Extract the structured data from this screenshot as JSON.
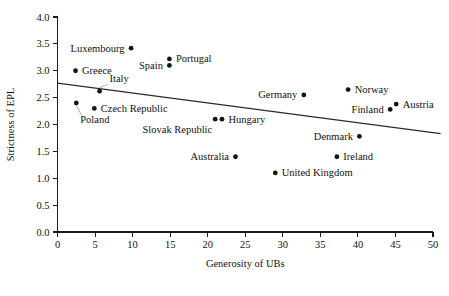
{
  "chart_data": {
    "type": "scatter",
    "title": "",
    "xlabel": "Generosity of UBs",
    "ylabel": "Strictness of EPL",
    "xlim": [
      0,
      50
    ],
    "ylim": [
      0,
      4.0
    ],
    "xticks": [
      0,
      5,
      10,
      15,
      20,
      25,
      30,
      35,
      40,
      45,
      50
    ],
    "xtick_labels": [
      "0",
      "5",
      "10",
      "15",
      "20",
      "25",
      "30",
      "35",
      "40",
      "45",
      "50"
    ],
    "yticks": [
      0.0,
      0.5,
      1.0,
      1.5,
      2.0,
      2.5,
      3.0,
      3.5,
      4.0
    ],
    "ytick_labels": [
      "0.0",
      "0.5",
      "1.0",
      "1.5",
      "2.0",
      "2.5",
      "3.0",
      "3.5",
      "4.0"
    ],
    "grid": false,
    "legend": "none",
    "points": [
      {
        "label": "Greece",
        "x": 2.4,
        "y": 3.0,
        "label_pos": "right"
      },
      {
        "label": "Poland",
        "x": 2.5,
        "y": 2.4,
        "label_pos": "below-leader"
      },
      {
        "label": "Czech Republic",
        "x": 4.9,
        "y": 2.3,
        "label_pos": "right"
      },
      {
        "label": "Italy",
        "x": 5.6,
        "y": 2.62,
        "label_pos": "above-leader"
      },
      {
        "label": "Luxembourg",
        "x": 9.8,
        "y": 3.42,
        "label_pos": "left"
      },
      {
        "label": "Spain",
        "x": 14.9,
        "y": 3.1,
        "label_pos": "left"
      },
      {
        "label": "Portugal",
        "x": 14.9,
        "y": 3.22,
        "label_pos": "right"
      },
      {
        "label": "Slovak Republic",
        "x": 21.0,
        "y": 2.1,
        "label_pos": "below-left"
      },
      {
        "label": "Hungary",
        "x": 21.9,
        "y": 2.1,
        "label_pos": "right"
      },
      {
        "label": "Australia",
        "x": 23.7,
        "y": 1.4,
        "label_pos": "left"
      },
      {
        "label": "United Kingdom",
        "x": 29.0,
        "y": 1.1,
        "label_pos": "right"
      },
      {
        "label": "Germany",
        "x": 32.8,
        "y": 2.55,
        "label_pos": "left"
      },
      {
        "label": "Ireland",
        "x": 37.2,
        "y": 1.4,
        "label_pos": "right"
      },
      {
        "label": "Norway",
        "x": 38.7,
        "y": 2.65,
        "label_pos": "right"
      },
      {
        "label": "Denmark",
        "x": 40.2,
        "y": 1.78,
        "label_pos": "left"
      },
      {
        "label": "Finland",
        "x": 44.3,
        "y": 2.28,
        "label_pos": "left"
      },
      {
        "label": "Austria",
        "x": 45.1,
        "y": 2.38,
        "label_pos": "right"
      }
    ],
    "trend_line": {
      "x0": 0.0,
      "y0": 2.77,
      "x1": 51.0,
      "y1": 1.83
    },
    "colors": {
      "marker": "#151515",
      "axis": "#1a1a1a",
      "trend": "#2b2b2b",
      "leader": "#8a8a8a",
      "background": "#ffffff"
    }
  }
}
